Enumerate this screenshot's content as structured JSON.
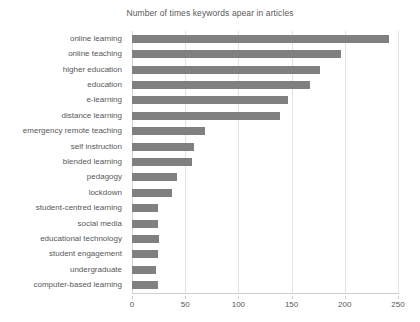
{
  "chart_data": {
    "type": "bar",
    "orientation": "horizontal",
    "title": "Number of times keywords apear in articles",
    "xlabel": "",
    "ylabel": "",
    "xlim": [
      0,
      250
    ],
    "ylim": null,
    "grid": true,
    "legend": false,
    "legend_position": "none",
    "bar_color": "#808080",
    "gridline_color": "#e2e2e2",
    "xticks": [
      0,
      50,
      100,
      150,
      200,
      250
    ],
    "xtick_labels": [
      "0",
      "50",
      "100",
      "150",
      "200",
      "250"
    ],
    "categories": [
      "online learning",
      "online teaching",
      "higher education",
      "education",
      "e-learning",
      "distance learning",
      "emergency remote teaching",
      "self instruction",
      "blended learning",
      "pedagogy",
      "lockdown",
      "student-centred learning",
      "social media",
      "educational technology",
      "student engagement",
      "undergraduate",
      "computer-based learning"
    ],
    "values": [
      242,
      196,
      177,
      167,
      147,
      139,
      69,
      58,
      56,
      42,
      38,
      24,
      24,
      25,
      24,
      23,
      24
    ],
    "series": [
      {
        "name": "Number of times keywords apear in articles",
        "values": [
          242,
          196,
          177,
          167,
          147,
          139,
          69,
          58,
          56,
          42,
          38,
          24,
          24,
          25,
          24,
          23,
          24
        ]
      }
    ]
  }
}
